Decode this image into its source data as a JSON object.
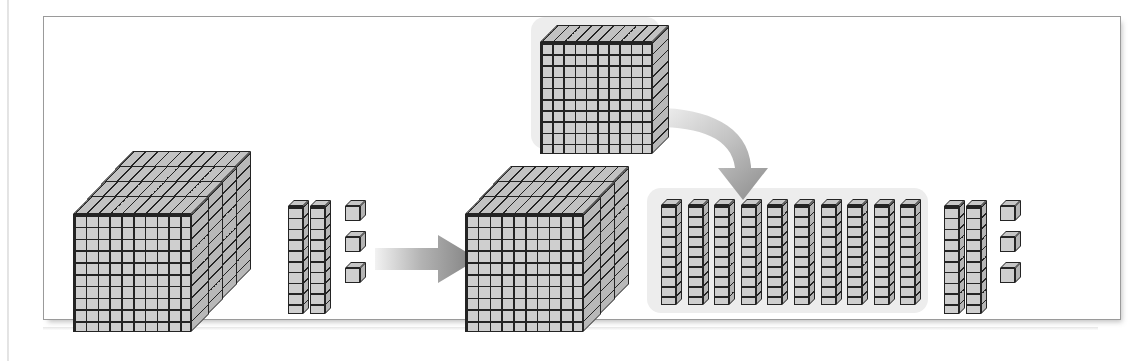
{
  "figure": {
    "frame": {
      "border_color": "#9a9a9a",
      "background": "#ffffff"
    },
    "colors": {
      "block_face": "#cfcfcf",
      "block_outline": "#242424",
      "highlight_background": "#ededed",
      "arrow_gray": "#8c8c8c",
      "arrow_light": "#e6e6e6"
    }
  },
  "chart_data": {
    "type": "diagram",
    "representation": "base-ten blocks (flats = 100, rods = 10, units = 1)",
    "before": {
      "label": "before regrouping",
      "flats": 4,
      "rods": 2,
      "units": 3,
      "value": 423
    },
    "after": {
      "label": "after regrouping",
      "flats": 3,
      "regrouped_flat": 1,
      "regrouped_rods": 10,
      "rods": 2,
      "units": 3,
      "value": 423
    },
    "annotations": [
      {
        "name": "transform-arrow",
        "direction": "right",
        "meaning": "becomes"
      },
      {
        "name": "regroup-arrow",
        "direction": "curved-down",
        "meaning": "one hundred is traded for ten tens"
      }
    ]
  },
  "groups": {
    "before": {
      "name": "before-group",
      "flats_count": 4,
      "rods_count": 2,
      "units_count": 3
    },
    "after": {
      "name": "after-group",
      "flats_count": 3,
      "rods_count": 2,
      "units_count": 3
    },
    "regroup": {
      "name": "regroup-group",
      "source_flat_count": 1,
      "result_rods_count": 10
    }
  },
  "block_specs": {
    "flat_grid_cols": 10,
    "flat_grid_rows": 10,
    "rod_segments": 10,
    "unit_faces": 3
  }
}
